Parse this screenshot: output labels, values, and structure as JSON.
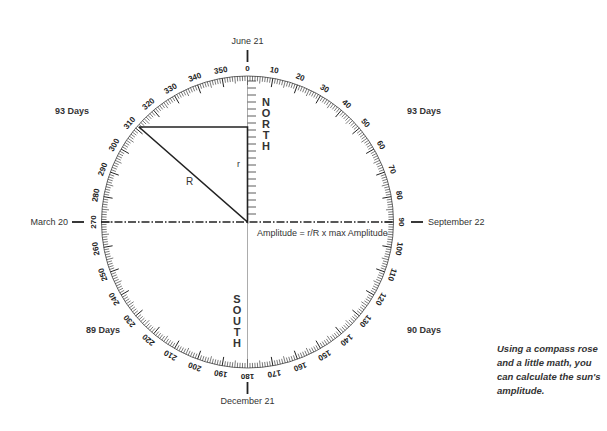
{
  "diagram": {
    "dates": {
      "top": "June 21",
      "bottom": "December 21",
      "left": "March 20",
      "right": "September 22"
    },
    "quadrant_days": {
      "top_left": "93 Days",
      "top_right": "93 Days",
      "bottom_left": "89 Days",
      "bottom_right": "90 Days"
    },
    "directions": {
      "north": "NORTH",
      "south": "SOUTH"
    },
    "degree_labels": [
      "0",
      "10",
      "20",
      "30",
      "40",
      "50",
      "60",
      "70",
      "80",
      "90",
      "100",
      "110",
      "120",
      "130",
      "140",
      "150",
      "160",
      "170",
      "180",
      "190",
      "200",
      "210",
      "220",
      "230",
      "240",
      "250",
      "260",
      "270",
      "280",
      "290",
      "300",
      "310",
      "320",
      "330",
      "340",
      "350"
    ],
    "triangle": {
      "hypotenuse_label": "R",
      "side_label": "r",
      "vertex_bearing": 310
    },
    "formula": "Amplitude = r/R x max Amplitude",
    "caption": "Using a compass rose and a little math, you can calculate the sun's amplitude.",
    "colors": {
      "ink": "#222222",
      "text": "#333333",
      "background": "#ffffff"
    }
  }
}
